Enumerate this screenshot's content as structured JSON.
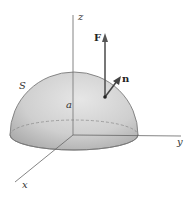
{
  "figure": {
    "labels": {
      "z_axis": "z",
      "y_axis": "y",
      "x_axis": "x",
      "surface": "S",
      "radius": "a",
      "force": "F",
      "normal": "n"
    },
    "colors": {
      "surface_fill": "#c9c9c9",
      "surface_edge": "#7a7a7a",
      "axis": "#555555",
      "arrow": "#444444",
      "background": "#ffffff"
    }
  }
}
